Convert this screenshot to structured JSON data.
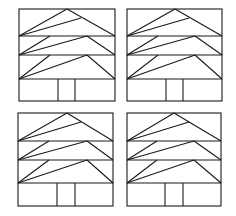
{
  "diagram": {
    "stroke_color": "#1a1a1a",
    "background": "#ffffff",
    "panels": [
      {
        "id": "top-left",
        "left": 19,
        "right": 115,
        "top": 9,
        "d1": 36,
        "d2": 55,
        "d3": 79,
        "bottom": 101,
        "apex": 67,
        "second_end_x": 81,
        "second_end_y": 18,
        "p1": 50,
        "p2": 87,
        "door_l": 58,
        "door_r": 75
      },
      {
        "id": "top-right",
        "left": 127,
        "right": 222,
        "top": 9,
        "d1": 36,
        "d2": 55,
        "d3": 79,
        "bottom": 101,
        "apex": 175,
        "second_end_x": 189,
        "second_end_y": 18,
        "p1": 158,
        "p2": 195,
        "door_l": 166,
        "door_r": 183
      },
      {
        "id": "bottom-left",
        "left": 18,
        "right": 113,
        "top": 113,
        "d1": 141,
        "d2": 160,
        "d3": 183,
        "bottom": 206,
        "apex": 67,
        "second_end_x": 81,
        "second_end_y": 122,
        "p1": 49,
        "p2": 87,
        "door_l": 57,
        "door_r": 75
      },
      {
        "id": "bottom-right",
        "left": 127,
        "right": 221,
        "top": 113,
        "d1": 141,
        "d2": 160,
        "d3": 183,
        "bottom": 206,
        "apex": 174,
        "second_end_x": 189,
        "second_end_y": 122,
        "p1": 157,
        "p2": 194,
        "door_l": 165,
        "door_r": 183
      }
    ]
  }
}
